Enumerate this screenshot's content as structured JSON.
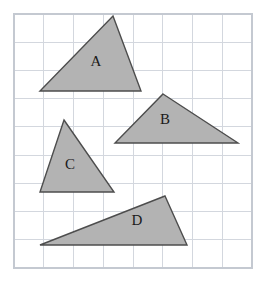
{
  "figure": {
    "type": "grid-triangles-diagram",
    "canvas": {
      "width": 267,
      "height": 283
    },
    "background_color": "#ffffff",
    "grid": {
      "x0": 14,
      "y0": 14,
      "x1": 252,
      "y1": 268,
      "columns": 8,
      "rows": 9,
      "cell_width": 29.75,
      "cell_height": 28.22,
      "line_color": "#d3d7de",
      "border_color": "#c4c9d1"
    },
    "shapes": [
      {
        "id": "triangle-a",
        "label": "A",
        "points": "113,16 141,91 40,91",
        "label_x": 96,
        "label_y": 63,
        "fill": "#b3b3b3",
        "stroke": "#4d4d4d",
        "stroke_width": 1.4
      },
      {
        "id": "triangle-b",
        "label": "B",
        "points": "163,94 238,143 115,143",
        "label_x": 165,
        "label_y": 121,
        "fill": "#b3b3b3",
        "stroke": "#4d4d4d",
        "stroke_width": 1.4
      },
      {
        "id": "triangle-c",
        "label": "C",
        "points": "64,120 114,192 40,192",
        "label_x": 70,
        "label_y": 166,
        "fill": "#b3b3b3",
        "stroke": "#4d4d4d",
        "stroke_width": 1.4
      },
      {
        "id": "triangle-d",
        "label": "D",
        "points": "165,196 187,245 40,245",
        "label_x": 137,
        "label_y": 222,
        "fill": "#b3b3b3",
        "stroke": "#4d4d4d",
        "stroke_width": 1.4
      }
    ]
  }
}
